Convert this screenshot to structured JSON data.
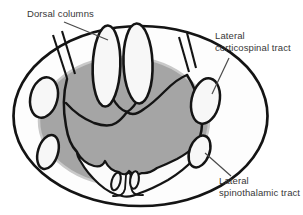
{
  "diagram": {
    "type": "spinal-cord-cross-section",
    "background_color": "#ffffff",
    "ink_color": "#141414",
    "gray_matter_fill": "#a5a5a5",
    "label_text_color": "#383838",
    "labels": {
      "dorsal_columns": {
        "text": "Dorsal columns"
      },
      "corticospinal": {
        "line1": "Lateral",
        "line2": "corticospinal tract"
      },
      "spinothalamic": {
        "line1": "Lateral",
        "line2": "spinothalamic tract"
      }
    }
  }
}
